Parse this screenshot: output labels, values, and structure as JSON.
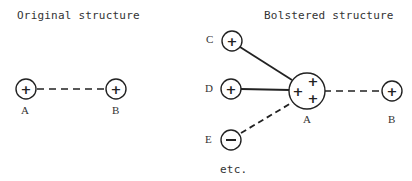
{
  "left_panel": {
    "title": "Original structure",
    "nodes": [
      {
        "id": "A",
        "label": "A",
        "sign": "+"
      },
      {
        "id": "B",
        "label": "B",
        "sign": "+"
      }
    ],
    "edges": [
      {
        "from": "A",
        "to": "B",
        "style": "dashed"
      }
    ]
  },
  "right_panel": {
    "title": "Bolstered structure",
    "nodes": [
      {
        "id": "C",
        "label": "C",
        "sign": "+"
      },
      {
        "id": "D",
        "label": "D",
        "sign": "+"
      },
      {
        "id": "E",
        "label": "E",
        "sign": "−"
      },
      {
        "id": "A",
        "label": "A",
        "sign": "+ + +"
      },
      {
        "id": "B",
        "label": "B",
        "sign": "+"
      }
    ],
    "edges": [
      {
        "from": "C",
        "to": "A",
        "style": "solid"
      },
      {
        "from": "D",
        "to": "A",
        "style": "solid"
      },
      {
        "from": "E",
        "to": "A",
        "style": "dashed"
      },
      {
        "from": "A",
        "to": "B",
        "style": "dashed"
      }
    ],
    "footnote": "etc."
  }
}
